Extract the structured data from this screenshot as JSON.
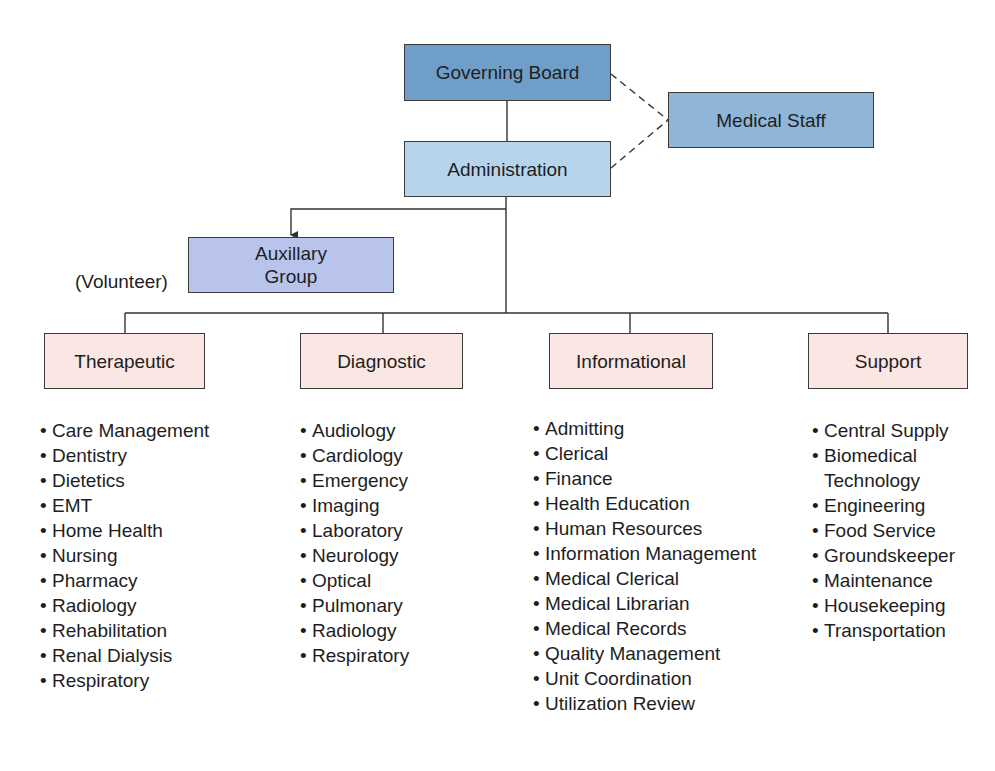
{
  "diagram": {
    "type": "organizational-chart",
    "nodes": {
      "governing_board": {
        "label": "Governing Board",
        "color": "#6f9fc8"
      },
      "medical_staff": {
        "label": "Medical Staff",
        "color": "#8fb6d8"
      },
      "administration": {
        "label": "Administration",
        "color": "#b6d5ec"
      },
      "auxillary_group": {
        "label_line1": "Auxillary",
        "label_line2": "Group",
        "color": "#b8c4ec",
        "note": "(Volunteer)"
      }
    },
    "categories": [
      {
        "label": "Therapeutic",
        "color": "#fae6e2",
        "items": [
          "Care Management",
          "Dentistry",
          "Dietetics",
          "EMT",
          "Home Health",
          "Nursing",
          "Pharmacy",
          "Radiology",
          "Rehabilitation",
          "Renal Dialysis",
          "Respiratory"
        ]
      },
      {
        "label": "Diagnostic",
        "color": "#fae6e2",
        "items": [
          "Audiology",
          "Cardiology",
          "Emergency",
          "Imaging",
          "Laboratory",
          "Neurology",
          "Optical",
          "Pulmonary",
          "Radiology",
          "Respiratory"
        ]
      },
      {
        "label": "Informational",
        "color": "#fae6e2",
        "items": [
          "Admitting",
          "Clerical",
          "Finance",
          "Health Education",
          "Human Resources",
          "Information Management",
          "Medical Clerical",
          "Medical Librarian",
          "Medical Records",
          "Quality Management",
          "Unit Coordination",
          "Utilization Review"
        ]
      },
      {
        "label": "Support",
        "color": "#fae6e2",
        "items": [
          "Central Supply",
          "Biomedical",
          "Engineering",
          "Food Service",
          "Groundskeeper",
          "Maintenance",
          "Housekeeping",
          "Transportation"
        ],
        "item_continuations": {
          "1": "Technology"
        }
      }
    ],
    "connections": [
      {
        "from": "Governing Board",
        "to": "Administration",
        "style": "solid"
      },
      {
        "from": "Governing Board",
        "to": "Medical Staff",
        "style": "dashed"
      },
      {
        "from": "Administration",
        "to": "Medical Staff",
        "style": "dashed"
      },
      {
        "from": "Administration",
        "to": "Auxillary Group",
        "style": "arrow"
      },
      {
        "from": "Administration",
        "to": "Therapeutic",
        "style": "solid"
      },
      {
        "from": "Administration",
        "to": "Diagnostic",
        "style": "solid"
      },
      {
        "from": "Administration",
        "to": "Informational",
        "style": "solid"
      },
      {
        "from": "Administration",
        "to": "Support",
        "style": "solid"
      }
    ],
    "bullet_char": "•"
  }
}
